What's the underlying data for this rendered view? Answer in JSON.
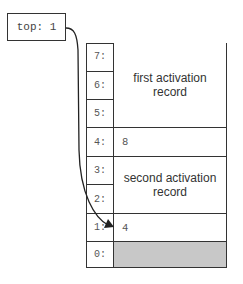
{
  "top_pointer": {
    "label": "top: 1",
    "points_to_address": 1
  },
  "stack": {
    "rows": [
      {
        "address": "7:",
        "value": ""
      },
      {
        "address": "6:",
        "value": ""
      },
      {
        "address": "5:",
        "value": ""
      },
      {
        "address": "4:",
        "value": "8"
      },
      {
        "address": "3:",
        "value": ""
      },
      {
        "address": "2:",
        "value": ""
      },
      {
        "address": "1:",
        "value": "4"
      },
      {
        "address": "0:",
        "value": ""
      }
    ],
    "records": [
      {
        "label": "first activation record",
        "line1": "first activation",
        "line2": "record",
        "spans": [
          "7:",
          "6:",
          "5:"
        ]
      },
      {
        "label": "second activation record",
        "line1": "second activation",
        "line2": "record",
        "spans": [
          "3:",
          "2:"
        ]
      }
    ],
    "shaded_row": "0:",
    "shade_color": "#c8c8c8"
  }
}
